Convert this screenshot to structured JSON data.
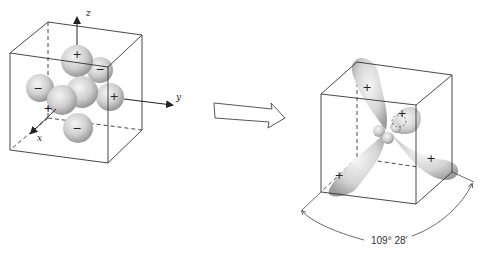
{
  "left_diagram": {
    "title": "unhybridized orbitals (s + p lobes)",
    "axes": {
      "z": "z",
      "y": "y",
      "x": "x"
    },
    "lobe_signs": {
      "top": "+",
      "upper_right_back": "−",
      "left": "−",
      "right": "+",
      "front": "+",
      "bottom": "−"
    }
  },
  "arrow": {
    "direction": "right"
  },
  "right_diagram": {
    "title": "sp3 hybrid orbitals",
    "lobe_signs": {
      "upper_left": "+",
      "upper_right": "+",
      "lower_left": "+",
      "lower_right": "+"
    },
    "bond_angle": "109° 28′"
  },
  "colors": {
    "line": "#333333",
    "lobe_light": "#f2f2f2",
    "lobe_dark": "#9a9a9a",
    "background": "#ffffff"
  }
}
